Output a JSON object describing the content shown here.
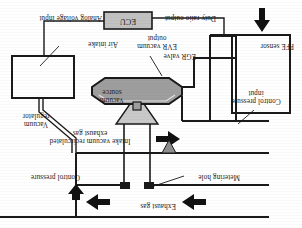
{
  "figure": {
    "orientation": "rotated-180",
    "colors": {
      "line": "#1a1a1a",
      "fill_gray": "#9a9a9a",
      "fill_light": "#d4d4d4",
      "box_fill": "#c8c8c8",
      "background": "#ffffff"
    }
  },
  "labels": {
    "exhaust_gas": "Exhaust gas",
    "metering_hole": "Metering hole",
    "intake_vacuum_line1": "Intake vacuum recirculated",
    "intake_vacuum_line2": "exhaust gas",
    "control_pressure": "Control pressure",
    "control_pressure_input_line1": "Control pressure",
    "control_pressure_input_line2": "input",
    "vacuum_regulator_line1": "Vacuum",
    "vacuum_regulator_line2": "regulator",
    "air_intake": "Air intake",
    "vacuum_source_line1": "Vacuum",
    "vacuum_source_line2": "source",
    "evr_vacuum_output_line1": "EVR vacuum",
    "evr_vacuum_output_line2": "output",
    "duty_ratio_output": "Duty ratio output",
    "ecu": "ECU",
    "analog_voltage_input": "Analog voltage input",
    "egr_valve": "EGR valve",
    "pfe_sensor": "PFE sensor"
  },
  "arrows": {
    "exhaust_gas_direction": "right",
    "intake_vacuum_direction": "left",
    "control_pressure_direction": "right",
    "air_intake_direction": "up"
  }
}
